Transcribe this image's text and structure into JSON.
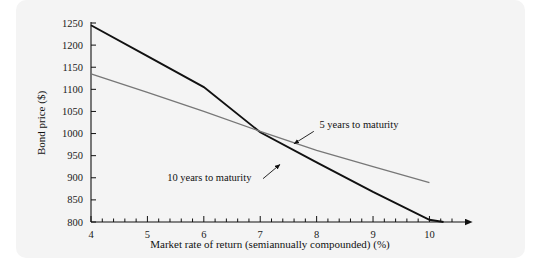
{
  "figure": {
    "panel_color": "#f4f4f4",
    "background_color": "#ffffff"
  },
  "chart_data": {
    "type": "line",
    "title": "",
    "subtitle": "",
    "xlabel": "Market rate of return (semiannually compounded) (%)",
    "ylabel": "Bond price ($)",
    "xlim": [
      4,
      10.4
    ],
    "ylim": [
      800,
      1250
    ],
    "xticks": [
      4,
      5,
      6,
      7,
      8,
      9,
      10
    ],
    "xtick_labels": [
      "4",
      "5",
      "6",
      "7",
      "8",
      "9",
      "10"
    ],
    "x_minor_tick_step": 0.2,
    "yticks": [
      800,
      850,
      900,
      950,
      1000,
      1050,
      1100,
      1150,
      1200,
      1250
    ],
    "ytick_labels": [
      "800",
      "850",
      "900",
      "950",
      "1000",
      "1050",
      "1100",
      "1150",
      "1200",
      "1250"
    ],
    "grid": false,
    "legend": "none",
    "x_axis_arrow": true,
    "series": [
      {
        "name": "10 years to maturity",
        "color": "#111111",
        "width": 1.9,
        "x": [
          4,
          5,
          6,
          7,
          8,
          9,
          10,
          10.25
        ],
        "values": [
          1245,
          1175,
          1105,
          1003,
          935,
          868,
          805,
          800
        ]
      },
      {
        "name": "5 years to maturity",
        "color": "#777777",
        "width": 1.3,
        "x": [
          4,
          5,
          6,
          7,
          8,
          9,
          10
        ],
        "values": [
          1135,
          1093,
          1050,
          1005,
          962,
          925,
          889
        ]
      }
    ],
    "annotations": [
      {
        "text": "5 years to maturity",
        "text_x": 8.05,
        "text_y": 1012,
        "arrow_from_x": 7.95,
        "arrow_from_y": 1005,
        "arrow_to_x": 7.6,
        "arrow_to_y": 977
      },
      {
        "text": "10 years to maturity",
        "text_x": 5.35,
        "text_y": 892,
        "arrow_from_x": 7.05,
        "arrow_from_y": 898,
        "arrow_to_x": 7.35,
        "arrow_to_y": 930
      }
    ]
  }
}
